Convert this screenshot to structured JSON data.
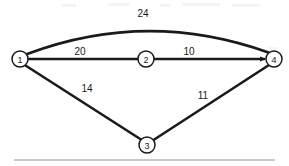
{
  "diagram": {
    "type": "weighted-graph",
    "title": "",
    "background_color": "#ffffff",
    "line_color": "#1a1a1a",
    "nodes": [
      {
        "id": "1",
        "label": "1",
        "x": 20,
        "y": 59,
        "r": 8
      },
      {
        "id": "2",
        "label": "2",
        "x": 146,
        "y": 59,
        "r": 8
      },
      {
        "id": "3",
        "label": "3",
        "x": 147,
        "y": 145,
        "r": 8
      },
      {
        "id": "4",
        "label": "4",
        "x": 274,
        "y": 59,
        "r": 8
      }
    ],
    "edges": [
      {
        "id": "edge-1-4",
        "from": "1",
        "to": "4",
        "weight": "24",
        "shape": "arc",
        "label_x": 143,
        "label_y": 13
      },
      {
        "id": "edge-1-2",
        "from": "1",
        "to": "2",
        "weight": "20",
        "shape": "straight",
        "label_x": 80,
        "label_y": 51
      },
      {
        "id": "edge-2-4",
        "from": "2",
        "to": "4",
        "weight": "10",
        "shape": "straight",
        "label_x": 189,
        "label_y": 51
      },
      {
        "id": "edge-1-3",
        "from": "1",
        "to": "3",
        "weight": "14",
        "shape": "straight",
        "label_x": 87,
        "label_y": 88
      },
      {
        "id": "edge-3-4",
        "from": "3",
        "to": "4",
        "weight": "11",
        "shape": "straight",
        "label_x": 203,
        "label_y": 95
      }
    ],
    "footer_rule": {
      "present": true,
      "y": 160,
      "color": "#b9b9bc"
    }
  }
}
